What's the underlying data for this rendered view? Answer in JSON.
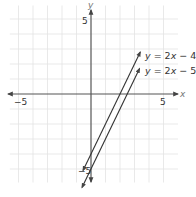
{
  "chart_data": {
    "type": "line",
    "title": "",
    "xlabel": "x",
    "ylabel": "y",
    "xlim": [
      -5.8,
      6.0
    ],
    "ylim": [
      -6.2,
      5.9
    ],
    "grid": true,
    "grid_step": 1,
    "x_ticks_labeled": [
      {
        "value": -5,
        "label": "−5"
      },
      {
        "value": 5,
        "label": "5"
      }
    ],
    "y_ticks_labeled": [
      {
        "value": 5,
        "label": "5"
      },
      {
        "value": -5,
        "label": "−5"
      }
    ],
    "series": [
      {
        "name": "y = 2x − 4",
        "equation": {
          "slope": 2,
          "intercept": -4
        },
        "x": [
          -0.55,
          3.4
        ],
        "y": [
          -5.1,
          2.8
        ],
        "arrows": "both",
        "color": "#333333"
      },
      {
        "name": "y = 2x − 5",
        "equation": {
          "slope": 2,
          "intercept": -5
        },
        "x": [
          -0.62,
          3.35
        ],
        "y": [
          -6.24,
          1.7
        ],
        "arrows": "both",
        "color": "#333333"
      }
    ],
    "legend": [
      {
        "text_y": "y",
        "text_eq": "= 2",
        "text_x": "x",
        "text_tail": "− 4"
      },
      {
        "text_y": "y",
        "text_eq": "= 2",
        "text_x": "x",
        "text_tail": "− 5"
      }
    ],
    "colors": {
      "axis": "#555555",
      "grid": "#e3e3e3",
      "line": "#333333",
      "text": "#333333"
    }
  },
  "labels": {
    "x_axis": "x",
    "y_axis": "y",
    "x_neg5": "−5",
    "x_pos5": "5",
    "y_pos5": "5",
    "y_neg5": "−5",
    "eq1_y": "y",
    "eq1_mid": " = 2",
    "eq1_x": "x",
    "eq1_tail": " − 4",
    "eq2_y": "y",
    "eq2_mid": " = 2",
    "eq2_x": "x",
    "eq2_tail": " − 5"
  }
}
